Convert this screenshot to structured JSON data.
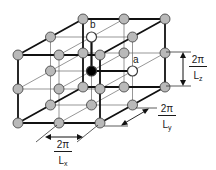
{
  "diagram": {
    "lattice": {
      "nx": 3,
      "ny": 3,
      "nz": 3,
      "origin_front_bottom_left": [
        18,
        123
      ],
      "step_x": [
        41,
        0
      ],
      "step_z": [
        0,
        -34
      ],
      "step_y": [
        32.5,
        -18
      ],
      "node_radius": 5
    },
    "colors": {
      "node_fill": "#b9b9b9",
      "node_stroke": "#3a3a3a",
      "thin_line": "#6a6a6a",
      "thick_line": "#111111",
      "center_node": "#000000",
      "open_node": "#ffffff"
    },
    "special_nodes": {
      "center": {
        "index": [
          1,
          1,
          1
        ],
        "fill": "black"
      },
      "a": {
        "index": [
          2,
          1,
          1
        ],
        "label": "a",
        "fill": "white"
      },
      "b": {
        "index": [
          1,
          1,
          2
        ],
        "label": "b",
        "fill": "white"
      }
    },
    "labels": {
      "a": "a",
      "b": "b"
    },
    "dimensions": {
      "lx": {
        "numerator": "2π",
        "denominator_main": "L",
        "denominator_sub": "x"
      },
      "ly": {
        "numerator": "2π",
        "denominator_main": "L",
        "denominator_sub": "y"
      },
      "lz": {
        "numerator": "2π",
        "denominator_main": "L",
        "denominator_sub": "z"
      }
    }
  }
}
